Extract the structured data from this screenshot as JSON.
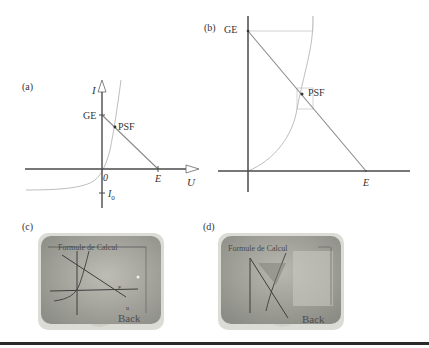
{
  "panels": {
    "a": {
      "label": "(a)",
      "y_axis_label": "I",
      "x_axis_label": "U",
      "origin_label": "0",
      "ge_label": "GE",
      "psf_label": "PSF",
      "e_label": "E",
      "i0_label": "I",
      "i0_sub": "0"
    },
    "b": {
      "label": "(b)",
      "ge_label": "GE",
      "psf_label": "PSF",
      "e_label": "E"
    },
    "c": {
      "label": "(c)",
      "screen_title": "Formule de Calcul",
      "back_label": "Back"
    },
    "d": {
      "label": "(d)",
      "screen_title": "Formule de Calcul",
      "back_label": "Back"
    }
  },
  "colors": {
    "axis": "#4a4a4a",
    "load_line": "#8a8a8a",
    "curve": "#b5b5b5",
    "screen_bg": "#a9a9a1",
    "bezel": "#d8d8d2"
  }
}
